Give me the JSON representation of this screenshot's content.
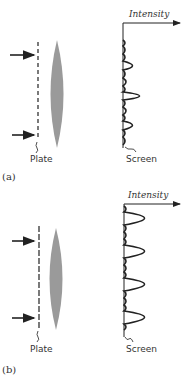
{
  "figure": {
    "panels": [
      {
        "caption": "(a)",
        "plate_label": "Plate",
        "screen_label": "Screen",
        "axis_label": "Intensity",
        "description": "Two-slit-like plate with lens; intensity pattern with central tall peak, two side peaks and small subsidiary maxima"
      },
      {
        "caption": "(b)",
        "plate_label": "Plate",
        "screen_label": "Screen",
        "axis_label": "Intensity",
        "description": "Grating plate with lens; intensity pattern with four equal tall principal maxima separated by small subsidiary maxima"
      }
    ],
    "colors": {
      "line": "#222222",
      "lens": "#9a9a9a",
      "background": "#ffffff"
    }
  }
}
